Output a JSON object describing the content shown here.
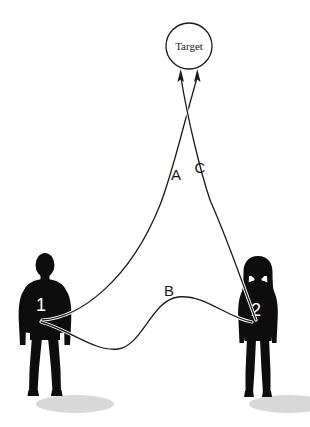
{
  "canvas": {
    "width": 310,
    "height": 427,
    "background": "#ffffff",
    "stroke_color": "#1a1a1a",
    "figure_color": "#0d0d0d",
    "shadow_color": "#d8d8d8",
    "number_color": "#ffffff"
  },
  "target": {
    "label": "Target",
    "cx": 189,
    "cy": 46,
    "r": 23
  },
  "labels": {
    "edge_a": "A",
    "edge_b": "B",
    "edge_c": "C"
  },
  "figures": [
    {
      "number": "1",
      "type": "male-silhouette",
      "cx": 45,
      "label_x": 41,
      "label_y": 305
    },
    {
      "number": "2",
      "type": "female-silhouette",
      "cx": 258,
      "label_x": 256,
      "label_y": 310
    }
  ],
  "edges": [
    {
      "id": "A",
      "from": "figure-1-hand",
      "to": "target",
      "arrowhead": true,
      "label": "A",
      "label_x": 176,
      "label_y": 180
    },
    {
      "id": "C",
      "from": "figure-2-hand",
      "to": "target",
      "arrowhead": true,
      "label": "C",
      "label_x": 200,
      "label_y": 173
    },
    {
      "id": "B",
      "from": "figure-1-hand",
      "to": "figure-2-hand",
      "arrowhead": false,
      "label": "B",
      "label_x": 169,
      "label_y": 296
    }
  ]
}
